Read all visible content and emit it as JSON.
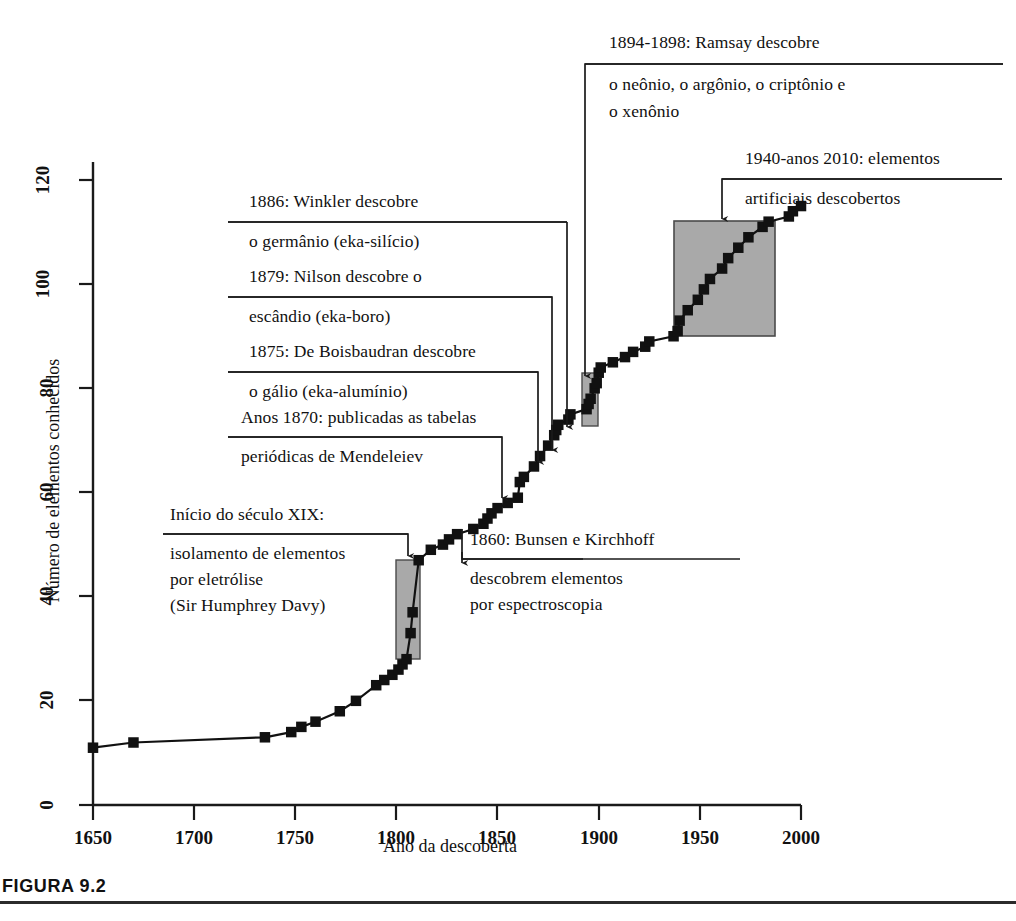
{
  "figure": {
    "caption_label": "FIGURA 9.2"
  },
  "chart_data": {
    "type": "line",
    "title": "",
    "xlabel": "Ano da descoberta",
    "ylabel": "Número de elementos conhecidos",
    "xlim": [
      1640,
      2010
    ],
    "ylim": [
      0,
      128
    ],
    "xticks": [
      1650,
      1700,
      1750,
      1800,
      1850,
      1900,
      1950,
      2000
    ],
    "xtick_labels": [
      "1650",
      "1700",
      "1750",
      "1800",
      "1850",
      "1900",
      "1950",
      "2000"
    ],
    "yticks": [
      0,
      20,
      40,
      60,
      80,
      100,
      120
    ],
    "ytick_labels": [
      "0",
      "20",
      "40",
      "60",
      "80",
      "100",
      "120"
    ],
    "grid": false,
    "legend": "none",
    "marker": "filled-square",
    "series": [
      {
        "name": "Elementos conhecidos",
        "x": [
          1650,
          1670,
          1735,
          1748,
          1753,
          1760,
          1772,
          1780,
          1790,
          1794,
          1798,
          1801,
          1803,
          1805,
          1807,
          1808,
          1811,
          1817,
          1823,
          1826,
          1830,
          1838,
          1843,
          1845,
          1847,
          1850,
          1855,
          1860,
          1861,
          1863,
          1868,
          1871,
          1875,
          1878,
          1879,
          1880,
          1885,
          1886,
          1894,
          1895,
          1896,
          1898,
          1899,
          1900,
          1901,
          1907,
          1913,
          1917,
          1923,
          1925,
          1937,
          1939,
          1940,
          1944,
          1949,
          1952,
          1955,
          1961,
          1964,
          1969,
          1974,
          1981,
          1984,
          1994,
          1996,
          2000
        ],
        "y": [
          11,
          12,
          13,
          14,
          15,
          16,
          18,
          20,
          23,
          24,
          25,
          26,
          27,
          28,
          33,
          37,
          47,
          49,
          50,
          51,
          52,
          53,
          54,
          55,
          56,
          57,
          58,
          59,
          62,
          63,
          65,
          67,
          69,
          71,
          72,
          73,
          74,
          75,
          76,
          77,
          78,
          80,
          81,
          83,
          84,
          85,
          86,
          87,
          88,
          89,
          90,
          91,
          93,
          95,
          97,
          99,
          101,
          103,
          105,
          107,
          109,
          111,
          112,
          113,
          114,
          115
        ]
      }
    ],
    "highlight_boxes": [
      {
        "name": "davy-electrolysis-box",
        "x_range": [
          1800,
          1813
        ],
        "y_range": [
          28,
          47
        ],
        "color": "#a9a9a9"
      },
      {
        "name": "ramsay-nobles-box",
        "x_range": [
          1893,
          1900
        ],
        "y_range": [
          73,
          83
        ],
        "color": "#a9a9a9"
      },
      {
        "name": "artificial-elements-box",
        "x_range": [
          1937,
          1987
        ],
        "y_range": [
          93,
          115
        ],
        "color": "#a9a9a9"
      }
    ]
  },
  "annotations": [
    {
      "id": "ramsay",
      "lines": [
        "1894-1898: Ramsay descobre",
        "o neônio, o argônio, o criptônio e",
        "o xenônio"
      ]
    },
    {
      "id": "artificial",
      "lines": [
        "1940-anos 2010: elementos",
        "artificiais descobertos"
      ]
    },
    {
      "id": "winkler",
      "lines": [
        "1886: Winkler descobre",
        "o germânio (eka-silício)"
      ]
    },
    {
      "id": "nilson",
      "lines": [
        "1879: Nilson descobre o",
        "escândio (eka-boro)"
      ]
    },
    {
      "id": "boisbaudran",
      "lines": [
        "1875: De Boisbaudran descobre",
        "o gálio (eka-alumínio)"
      ]
    },
    {
      "id": "mendeleiev",
      "lines": [
        "Anos 1870: publicadas as tabelas",
        "periódicas de Mendeleiev"
      ]
    },
    {
      "id": "davy",
      "lines": [
        "Início do século XIX:",
        "isolamento de elementos",
        "por eletrólise",
        "(Sir Humphrey Davy)"
      ]
    },
    {
      "id": "bunsen",
      "lines": [
        "1860: Bunsen e Kirchhoff",
        "descobrem elementos",
        "por espectroscopia"
      ]
    }
  ],
  "colors": {
    "axis": "#1a1a1a",
    "line": "#111111",
    "marker": "#111111",
    "highlight": "#a9a9a9",
    "text": "#111111"
  }
}
